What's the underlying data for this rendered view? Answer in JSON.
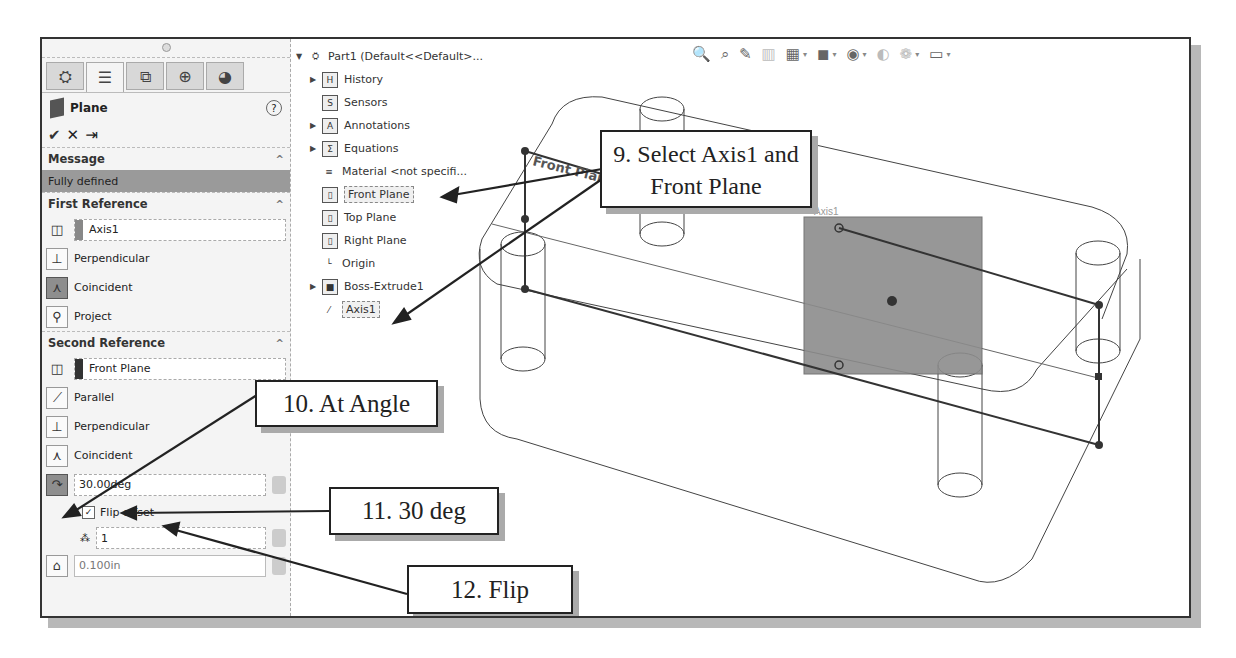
{
  "panel": {
    "tabs": [
      {
        "icon": "feature-manager-icon",
        "glyph": "⛭"
      },
      {
        "icon": "property-manager-icon",
        "glyph": "☰"
      },
      {
        "icon": "configuration-manager-icon",
        "glyph": "⧉"
      },
      {
        "icon": "dimxpert-icon",
        "glyph": "⊕"
      },
      {
        "icon": "display-manager-icon",
        "glyph": "◕"
      }
    ],
    "title": "Plane",
    "help": "?",
    "actions": {
      "ok": "✔",
      "cancel": "✕",
      "pin": "⇥"
    },
    "message": {
      "header": "Message",
      "text": "Fully defined"
    },
    "first_reference": {
      "header": "First Reference",
      "selection": "Axis1",
      "selection_color": "#888888",
      "options": [
        "Perpendicular",
        "Coincident",
        "Project"
      ],
      "active_option": "Coincident"
    },
    "second_reference": {
      "header": "Second Reference",
      "selection": "Front Plane",
      "selection_color": "#333333",
      "options": [
        "Parallel",
        "Perpendicular",
        "Coincident"
      ],
      "angle_value": "30.00deg",
      "flip_offset_label": "Flip offset",
      "flip_offset_checked": true,
      "instances_value": "1",
      "offset_value": "0.100in"
    }
  },
  "tree": {
    "root": "Part1  (Default<<Default>...",
    "items": [
      {
        "label": "History",
        "expand": true,
        "icon": "H"
      },
      {
        "label": "Sensors",
        "expand": false,
        "icon": "S"
      },
      {
        "label": "Annotations",
        "expand": true,
        "icon": "A"
      },
      {
        "label": "Equations",
        "expand": true,
        "icon": "Σ"
      },
      {
        "label": "Material <not specifi...",
        "expand": false,
        "icon": "≡"
      },
      {
        "label": "Front Plane",
        "expand": false,
        "icon": "▯",
        "highlight": true
      },
      {
        "label": "Top Plane",
        "expand": false,
        "icon": "▯"
      },
      {
        "label": "Right Plane",
        "expand": false,
        "icon": "▯"
      },
      {
        "label": "Origin",
        "expand": false,
        "icon": "└"
      },
      {
        "label": "Boss-Extrude1",
        "expand": true,
        "icon": "■"
      },
      {
        "label": "Axis1",
        "expand": false,
        "icon": "⁄",
        "highlight": true
      }
    ]
  },
  "toolbar": {
    "icons": [
      "zoom-to-fit",
      "zoom-to-area",
      "previous-view",
      "section-view",
      "view-orientation",
      "display-style",
      "hide-show-items",
      "edit-appearance",
      "apply-scene",
      "view-settings"
    ]
  },
  "viewport": {
    "axis_label": "Axis1",
    "plane_label": "Front Plane",
    "preview_plane_color": "#8c8c8c"
  },
  "callouts": {
    "c9": "9. Select Axis1 and",
    "c9b": "Front Plane",
    "c10": "10. At Angle",
    "c11": "11. 30 deg",
    "c12": "12. Flip"
  }
}
